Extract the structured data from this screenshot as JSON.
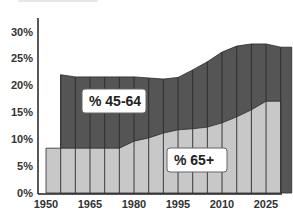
{
  "chart_data": {
    "type": "area",
    "stacked": true,
    "title": "",
    "xlabel": "",
    "ylabel": "",
    "x": [
      1950,
      1955,
      1960,
      1965,
      1970,
      1975,
      1980,
      1985,
      1990,
      1995,
      2000,
      2005,
      2010,
      2015,
      2020,
      2025,
      2030
    ],
    "x_tick_labels": [
      "1950",
      "1965",
      "1980",
      "1995",
      "2010",
      "2025"
    ],
    "y_tick_labels": [
      "0%",
      "5%",
      "10%",
      "15%",
      "20%",
      "25%",
      "30%"
    ],
    "ylim": [
      0,
      30
    ],
    "grid": false,
    "series": [
      {
        "name": "% 65+",
        "color": "#c8c8c8",
        "values": [
          8.3,
          8.3,
          8.3,
          8.3,
          8.3,
          8.3,
          9.6,
          10.2,
          11.1,
          11.7,
          11.9,
          12.2,
          13.0,
          14.1,
          15.4,
          17.0,
          17.0
        ]
      },
      {
        "name": "% 45-64",
        "color": "#555555",
        "values": [
          null,
          13.6,
          13.2,
          13.2,
          13.2,
          13.2,
          11.9,
          11.1,
          10.0,
          9.7,
          10.9,
          12.1,
          13.1,
          13.1,
          12.2,
          10.6,
          10.0
        ]
      }
    ],
    "totals": [
      null,
      21.9,
      21.5,
      21.5,
      21.5,
      21.5,
      21.5,
      21.3,
      21.1,
      21.4,
      22.8,
      24.3,
      26.1,
      27.2,
      27.6,
      27.6,
      27.0
    ],
    "annotations": [
      "% 45-64",
      "% 65+"
    ],
    "legend": "inline labels"
  },
  "labels": {
    "series_45_64": "% 45-64",
    "series_65_plus": "% 65+"
  },
  "axis": {
    "y_ticks": [
      "0%",
      "5%",
      "10%",
      "15%",
      "20%",
      "25%",
      "30%"
    ],
    "x_ticks": [
      "1950",
      "1965",
      "1980",
      "1995",
      "2010",
      "2025"
    ]
  },
  "colors": {
    "light_area": "#c8c8c8",
    "dark_area": "#555555",
    "separator": "#2a2a2a",
    "axis": "#222222"
  }
}
